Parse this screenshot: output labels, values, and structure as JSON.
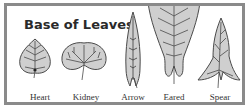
{
  "title": "Base of Leaves",
  "colors": {
    "frame": "#8a8a8a",
    "leaf_fill": "#cfcfcf",
    "leaf_stroke": "#4a4a4a",
    "text": "#2a2a2a"
  },
  "leaves": [
    {
      "name": "heart",
      "label": "Heart"
    },
    {
      "name": "kidney",
      "label": "Kidney"
    },
    {
      "name": "arrow",
      "label": "Arrow"
    },
    {
      "name": "eared",
      "label": "Eared"
    },
    {
      "name": "spear",
      "label": "Spear"
    }
  ]
}
